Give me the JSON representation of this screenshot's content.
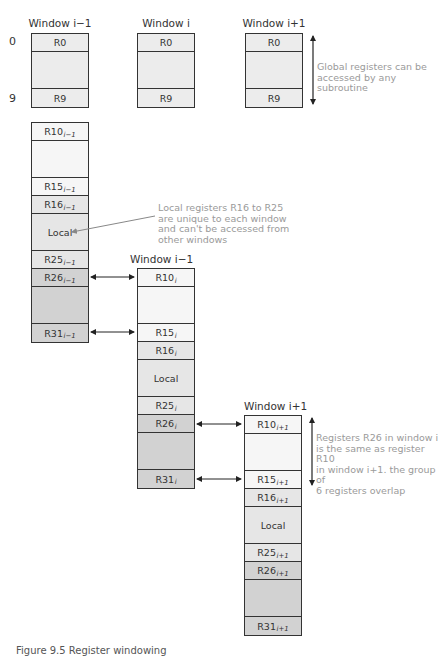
{
  "global": {
    "row_index_top": "0",
    "row_index_bottom": "9",
    "windows": [
      {
        "title": "Window i−1",
        "top_reg": "R0",
        "bottom_reg": "R9"
      },
      {
        "title": "Window i",
        "top_reg": "R0",
        "bottom_reg": "R9"
      },
      {
        "title": "Window i+1",
        "top_reg": "R0",
        "bottom_reg": "R9"
      }
    ],
    "note": "Global registers can be accessed by any subroutine"
  },
  "windows": [
    {
      "title": "",
      "sub": "i−1",
      "cells": {
        "r10": "R10",
        "r15": "R15",
        "r16": "R16",
        "local": "Local",
        "r25": "R25",
        "r26": "R26",
        "r31": "R31"
      }
    },
    {
      "title": "Window i−1",
      "sub": "i",
      "cells": {
        "r10": "R10",
        "r15": "R15",
        "r16": "R16",
        "local": "Local",
        "r25": "R25",
        "r26": "R26",
        "r31": "R31"
      }
    },
    {
      "title": "Window i+1",
      "sub": "i+1",
      "cells": {
        "r10": "R10",
        "r15": "R15",
        "r16": "R16",
        "local": "Local",
        "r25": "R25",
        "r26": "R26",
        "r31": "R31"
      }
    }
  ],
  "notes": {
    "local": [
      "Local registers R16 to R25",
      "are unique to each window",
      "and can't be accessed from",
      "other windows"
    ],
    "overlap": [
      "Registers R26 in window i",
      "is the same as register R10",
      "in window i+1. the group of",
      "6 registers overlap"
    ]
  },
  "colors": {
    "global_fill": "#ececec",
    "in_fill": "#f6f6f6",
    "local_fill": "#e6e6e6",
    "out_fill": "#d2d2d2",
    "note_text": "#9a9a9a",
    "stroke": "#333333"
  },
  "caption": "Figure 9.5 Register windowing"
}
